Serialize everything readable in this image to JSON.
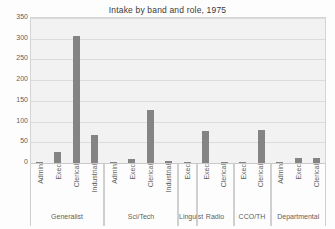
{
  "chart_data": {
    "type": "bar",
    "title": "Intake by band and role, 1975",
    "xlabel": "",
    "ylabel": "",
    "ylim": [
      0,
      350
    ],
    "yticks": [
      0,
      50,
      100,
      150,
      200,
      250,
      300,
      350
    ],
    "grid": true,
    "legend": "none",
    "bar_color": "#848484",
    "plot_background": "#f2f2f2",
    "groups": [
      {
        "band": "Generalist",
        "categories": [
          "Admin",
          "Exec",
          "Clerical",
          "Industrial"
        ],
        "values": [
          1,
          27,
          307,
          67
        ]
      },
      {
        "band": "Sci/Tech",
        "categories": [
          "Admin",
          "Exec",
          "Clerical",
          "Industrial"
        ],
        "values": [
          1,
          10,
          127,
          5
        ]
      },
      {
        "band": "Linguist",
        "categories": [
          "Exec"
        ],
        "values": [
          2
        ]
      },
      {
        "band": "Radio",
        "categories": [
          "Exec",
          "Clerical"
        ],
        "values": [
          77,
          3
        ]
      },
      {
        "band": "CCO/TH",
        "categories": [
          "Exec",
          "Clerical"
        ],
        "values": [
          1,
          79
        ]
      },
      {
        "band": "Departmental",
        "categories": [
          "Admin",
          "Exec",
          "Clerical"
        ],
        "values": [
          2,
          11,
          13
        ]
      }
    ],
    "categories": [
      "Admin",
      "Exec",
      "Clerical",
      "Industrial",
      "Admin",
      "Exec",
      "Clerical",
      "Industrial",
      "Exec",
      "Exec",
      "Clerical",
      "Exec",
      "Clerical",
      "Admin",
      "Exec",
      "Clerical"
    ],
    "values": [
      1,
      27,
      307,
      67,
      1,
      10,
      127,
      5,
      2,
      77,
      3,
      1,
      79,
      2,
      11,
      13
    ]
  }
}
